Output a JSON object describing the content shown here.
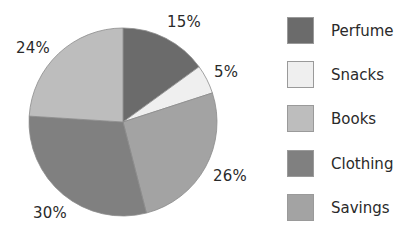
{
  "chart_data": {
    "type": "pie",
    "title": "",
    "categories": [
      "Perfume",
      "Snacks",
      "Savings",
      "Clothing",
      "Books"
    ],
    "values": [
      15,
      5,
      26,
      30,
      24
    ],
    "labels": [
      "15%",
      "5%",
      "26%",
      "30%",
      "24%"
    ],
    "colors": [
      "#6b6b6b",
      "#efefef",
      "#a3a3a3",
      "#808080",
      "#bdbdbd"
    ],
    "start_angle": "12 o'clock",
    "direction": "clockwise",
    "legend": {
      "position": "right",
      "entries": [
        {
          "label": "Perfume",
          "color": "#6b6b6b"
        },
        {
          "label": "Snacks",
          "color": "#efefef"
        },
        {
          "label": "Books",
          "color": "#bdbdbd"
        },
        {
          "label": "Clothing",
          "color": "#808080"
        },
        {
          "label": "Savings",
          "color": "#a3a3a3"
        }
      ]
    }
  },
  "pie_labels": {
    "perfume": "15%",
    "snacks": "5%",
    "savings": "26%",
    "clothing": "30%",
    "books": "24%"
  },
  "legend": {
    "items": [
      {
        "label": "Perfume",
        "color": "#6b6b6b"
      },
      {
        "label": "Snacks",
        "color": "#efefef"
      },
      {
        "label": "Books",
        "color": "#bdbdbd"
      },
      {
        "label": "Clothing",
        "color": "#808080"
      },
      {
        "label": "Savings",
        "color": "#a3a3a3"
      }
    ]
  }
}
